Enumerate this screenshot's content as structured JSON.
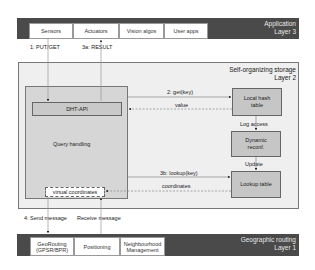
{
  "layer3": {
    "title": "Application",
    "subtitle": "Layer 3",
    "tabs": [
      "Sensors",
      "Actuators",
      "Vision algos",
      "User apps"
    ]
  },
  "layer2": {
    "title": "Self-organizing storage",
    "subtitle": "Layer 2",
    "query_handling": "Query handling",
    "dht_api": "DHT-API",
    "virtual_coordinates": "virtual coordinates",
    "local_hash_table": "Local hash table",
    "dynamic_reconf": "Dynamic reconf.",
    "lookup_table": "Lookup table"
  },
  "layer1": {
    "title": "Geographic routing",
    "subtitle": "Layer 1",
    "tabs": [
      "GeoRouting (GPSR/BPR)",
      "Positioning",
      "Neighbourhood Management"
    ]
  },
  "arrows": {
    "put_get": "1: PUT/GET",
    "result": "3a: RESULT",
    "get_key": "2: get(key)",
    "value": "value",
    "log_access": "Log access",
    "update": "Update",
    "lookup_key": "3b: lookup(key)",
    "coordinates": "coordinates",
    "send_message": "4: Send message",
    "receive_message": "Receive message"
  }
}
